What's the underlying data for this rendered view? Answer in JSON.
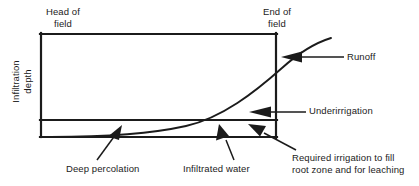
{
  "figure": {
    "type": "irrigation-infiltration-profile-diagram",
    "axis": {
      "y_label_line1": "Infiltration",
      "y_label_line2": "depth"
    },
    "boundaries": {
      "head_of_field_line1": "Head of",
      "head_of_field_line2": "field",
      "end_of_field_line1": "End of",
      "end_of_field_line2": "field"
    },
    "callouts": [
      {
        "id": "runoff",
        "label": "Runoff",
        "arrow": "left"
      },
      {
        "id": "underirrigation",
        "label": "Underirrigation",
        "arrow": "left"
      },
      {
        "id": "deep-percolation",
        "label": "Deep percolation",
        "arrow": "up-right"
      },
      {
        "id": "infiltrated-water",
        "label": "Infiltrated water",
        "arrow": "up-left"
      },
      {
        "id": "required-irrigation",
        "label_line1": "Required irrigation to fill",
        "label_line2": "root zone and for leaching",
        "arrow": "up-left"
      }
    ],
    "colors": {
      "stroke": "#1b1b1b",
      "text": "#1b1b1b",
      "background": "#ffffff"
    }
  }
}
